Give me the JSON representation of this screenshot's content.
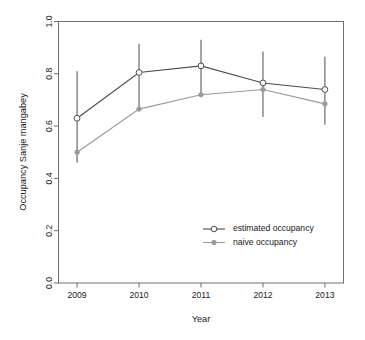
{
  "chart_data": {
    "type": "line",
    "title": "",
    "xlabel": "Year",
    "ylabel": "Occupancy Sanje mangabey",
    "x": [
      2009,
      2010,
      2011,
      2012,
      2013
    ],
    "xtick_labels": [
      "2009",
      "2010",
      "2011",
      "2012",
      "2013"
    ],
    "ytick_labels": [
      "0.0",
      "0.2",
      "0.4",
      "0.6",
      "0.8",
      "1.0"
    ],
    "ytick_values": [
      0.0,
      0.2,
      0.4,
      0.6,
      0.8,
      1.0
    ],
    "ylim": [
      0.0,
      1.0
    ],
    "xlim": [
      2008.7,
      2013.3
    ],
    "grid": false,
    "legend_position": "bottom-right",
    "series": [
      {
        "name": "estimated occupancy",
        "marker": "open-circle",
        "color": "#4d4d4d",
        "values": [
          0.63,
          0.805,
          0.83,
          0.765,
          0.74
        ],
        "error_low": [
          0.46,
          0.665,
          0.72,
          0.635,
          0.605
        ],
        "error_high": [
          0.81,
          0.915,
          0.93,
          0.885,
          0.865
        ]
      },
      {
        "name": "naive occupancy",
        "marker": "filled-circle",
        "color": "#9a9a9a",
        "values": [
          0.5,
          0.665,
          0.72,
          0.74,
          0.685
        ],
        "error_low": [
          null,
          null,
          null,
          null,
          null
        ],
        "error_high": [
          null,
          null,
          null,
          null,
          null
        ]
      }
    ]
  },
  "legend": {
    "entries": [
      {
        "label": "estimated occupancy"
      },
      {
        "label": "naive occupancy"
      }
    ]
  },
  "axes": {
    "x_title": "Year",
    "y_title": "Occupancy Sanje mangabey"
  }
}
